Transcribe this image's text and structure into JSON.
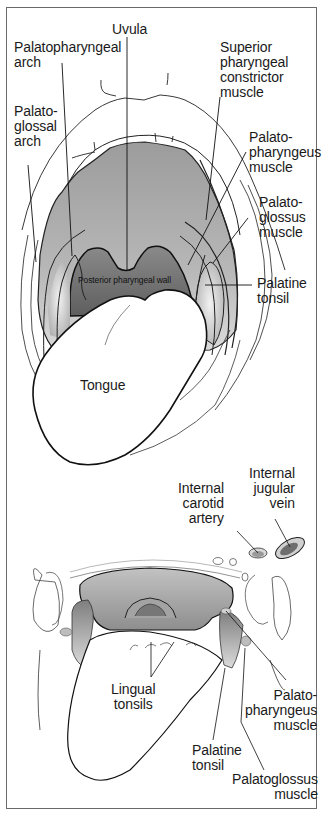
{
  "figure": {
    "top_view": {
      "name": "Open mouth anterior view",
      "labels": {
        "uvula": "Uvula",
        "palatopharyngeal_arch": "Palatopharyngeal\narch",
        "superior_pharyngeal_constrictor": "Superior\npharyngeal\nconstrictor\nmuscle",
        "palatoglossal_arch": "Palato-\nglossal\narch",
        "palatopharyngeus_muscle": "Palato-\npharyngeus\nmuscle",
        "palatoglossus_muscle": "Palato-\nglossus\nmuscle",
        "posterior_pharyngeal_wall": "Posterior pharyngeal wall",
        "palatine_tonsil": "Palatine\ntonsil",
        "tongue": "Tongue"
      }
    },
    "bottom_view": {
      "name": "Axial cross-section view",
      "labels": {
        "internal_carotid_artery": "Internal\ncarotid\nartery",
        "internal_jugular_vein": "Internal\njugular\nvein",
        "lingual_tonsils": "Lingual\ntonsils",
        "palatopharyngeus_muscle": "Palato-\npharyngeus\nmuscle",
        "palatine_tonsil": "Palatine\ntonsil",
        "palatoglossus_muscle": "Palatoglossus\nmuscle"
      }
    },
    "colors": {
      "line": "#111111",
      "pharynx_gray": "#9a9a9a",
      "wall_dark": "#6f6f6f",
      "light_gray": "#d4d4d4",
      "frame": "#6a6a6a"
    }
  }
}
